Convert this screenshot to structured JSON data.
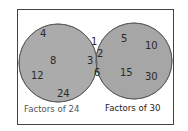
{
  "diagram": {
    "type": "venn",
    "sets": [
      {
        "id": "A",
        "label": "Factors of 24",
        "only": [
          "4",
          "8",
          "12",
          "24"
        ]
      },
      {
        "id": "B",
        "label": "Factors of 30",
        "only": [
          "5",
          "10",
          "15",
          "30"
        ]
      }
    ],
    "intersection": [
      "1",
      "2",
      "3",
      "6"
    ],
    "colors": {
      "circle_fill": "#a9a9a9",
      "overlap_fill": "#999999",
      "stroke": "#555555",
      "frame": "#444444"
    }
  },
  "labels": {
    "left": "Factors of 24",
    "right": "Factors of 30"
  },
  "numbers": {
    "left": {
      "n4": "4",
      "n8": "8",
      "n12": "12",
      "n24": "24"
    },
    "mid": {
      "n1": "1",
      "n2": "2",
      "n3": "3",
      "n6": "6"
    },
    "right": {
      "n5": "5",
      "n10": "10",
      "n15": "15",
      "n30": "30"
    }
  }
}
